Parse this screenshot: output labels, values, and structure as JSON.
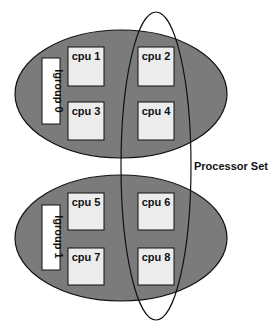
{
  "colors": {
    "lgroup_fill": "#7b7b7b",
    "cpu_fill": "#ececec",
    "outline": "#111111",
    "label_fill": "#ffffff"
  },
  "lgroups": [
    {
      "label": "lgroup 0",
      "cpus": [
        "cpu 1",
        "cpu 2",
        "cpu 3",
        "cpu 4"
      ]
    },
    {
      "label": "lgroup 1",
      "cpus": [
        "cpu 5",
        "cpu 6",
        "cpu 7",
        "cpu 8"
      ]
    }
  ],
  "processor_set": {
    "label": "Processor Set",
    "member_cpus": [
      "cpu 2",
      "cpu 4",
      "cpu 6",
      "cpu 8"
    ]
  }
}
